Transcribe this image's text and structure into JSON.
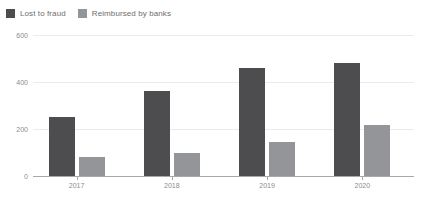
{
  "legend": {
    "position": "top-left",
    "items": [
      {
        "label": "Lost to fraud",
        "color": "#4d4d4f",
        "swatch_name": "legend-swatch-lost-to-fraud"
      },
      {
        "label": "Reimbursed by banks",
        "color": "#939598",
        "swatch_name": "legend-swatch-reimbursed-by-banks"
      }
    ]
  },
  "colors": {
    "series_lost": "#4d4d4f",
    "series_reimbursed": "#939598",
    "gridline": "#ebebeb",
    "axis": "#a7a9ac",
    "tick_text": "#8a8c8e",
    "legend_text": "#6d6e71",
    "background": "#ffffff"
  },
  "axes": {
    "y_ticks": [
      "0",
      "200",
      "400",
      "600"
    ],
    "y_tick_values": [
      0,
      200,
      400,
      600
    ],
    "x_ticks": [
      "2017",
      "2018",
      "2019",
      "2020"
    ]
  },
  "chart_data": {
    "type": "bar",
    "title": "",
    "subtitle": "",
    "xlabel": "",
    "ylabel": "",
    "categories": [
      "2017",
      "2018",
      "2019",
      "2020"
    ],
    "series": [
      {
        "name": "Lost to fraud",
        "color": "#4d4d4f",
        "values": [
          250,
          360,
          460,
          480
        ]
      },
      {
        "name": "Reimbursed by banks",
        "color": "#939598",
        "values": [
          80,
          100,
          145,
          215
        ]
      }
    ],
    "ylim": [
      0,
      600
    ],
    "yticks": [
      0,
      200,
      400,
      600
    ],
    "grid": true,
    "legend_position": "top-left"
  }
}
